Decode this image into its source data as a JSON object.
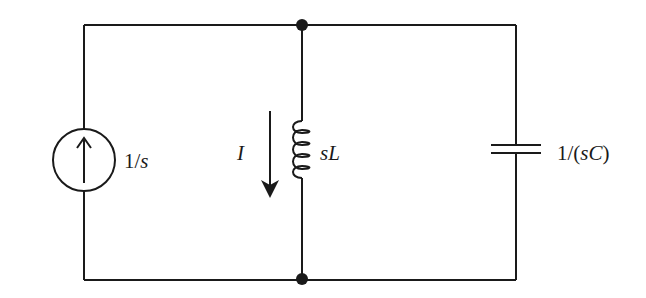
{
  "diagram": {
    "type": "circuit",
    "components": [
      {
        "id": "source",
        "kind": "current-source",
        "direction": "up",
        "label": {
          "num": "1/",
          "var": "s"
        }
      },
      {
        "id": "inductor",
        "kind": "inductor",
        "label": {
          "var": "sL"
        }
      },
      {
        "id": "capacitor",
        "kind": "capacitor",
        "label": {
          "pre": "1/(",
          "var": "sC",
          "post": ")"
        }
      }
    ],
    "current_arrow": {
      "label": "I",
      "direction": "down"
    },
    "nodes": [
      {
        "id": "top-node",
        "x": 302,
        "y": 25
      },
      {
        "id": "bottom-node",
        "x": 302,
        "y": 279
      }
    ],
    "colors": {
      "line": "#1a1a1a",
      "background": "#ffffff"
    }
  }
}
